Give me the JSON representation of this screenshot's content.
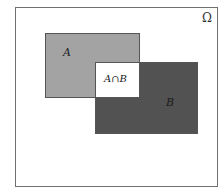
{
  "diagram": {
    "type": "venn-rectangles",
    "universe": {
      "label": "Ω"
    },
    "sets": [
      {
        "id": "A",
        "label": "A",
        "fill": "#a3a3a3"
      },
      {
        "id": "B",
        "label": "B",
        "fill": "#525252"
      }
    ],
    "intersection": {
      "label": "A∩B",
      "fill": "#ffffff"
    },
    "colors": {
      "border": "#555555",
      "frame": "#707070",
      "background": "#ffffff"
    }
  }
}
